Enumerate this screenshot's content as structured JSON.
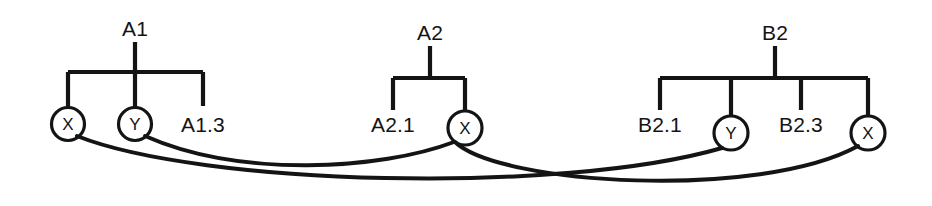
{
  "diagram": {
    "width": 932,
    "height": 206,
    "background_color": "#ffffff",
    "line_color": "#141414",
    "node_fill_color": "#ffffff"
  },
  "trees": [
    {
      "id": "A1",
      "root_label": "A1",
      "root_x": 135,
      "root_label_y": 36,
      "stem_top_y": 42,
      "bar_y": 72,
      "children": [
        {
          "id": "A1-x",
          "label": "X",
          "type": "circle",
          "x": 68,
          "cy": 124,
          "r": 16.5,
          "drop_to_y": 107.5
        },
        {
          "id": "A1-y",
          "label": "Y",
          "type": "circle",
          "x": 135,
          "cy": 124,
          "r": 16.5,
          "drop_to_y": 107.5
        },
        {
          "id": "A1-3",
          "label": "A1.3",
          "type": "leaf",
          "x": 203,
          "drop_to_y": 106,
          "label_y": 132
        }
      ]
    },
    {
      "id": "A2",
      "root_label": "A2",
      "root_x": 430,
      "root_label_y": 40,
      "stem_top_y": 46,
      "bar_y": 78,
      "children": [
        {
          "id": "A2-1",
          "label": "A2.1",
          "type": "leaf",
          "x": 393,
          "drop_to_y": 110,
          "label_y": 132
        },
        {
          "id": "A2-x",
          "label": "X",
          "type": "circle",
          "x": 465,
          "cy": 128,
          "r": 17.0,
          "drop_to_y": 111
        }
      ]
    },
    {
      "id": "B2",
      "root_label": "B2",
      "root_x": 775,
      "root_label_y": 40,
      "stem_top_y": 46,
      "bar_y": 78,
      "children": [
        {
          "id": "B2-1",
          "label": "B2.1",
          "type": "leaf",
          "x": 660,
          "drop_to_y": 110,
          "label_y": 132
        },
        {
          "id": "B2-y",
          "label": "Y",
          "type": "circle",
          "x": 731,
          "cy": 133,
          "r": 17.0,
          "drop_to_y": 116
        },
        {
          "id": "B2-3",
          "label": "B2.3",
          "type": "leaf",
          "x": 801,
          "drop_to_y": 110,
          "label_y": 132
        },
        {
          "id": "B2-x",
          "label": "X",
          "type": "circle",
          "x": 868,
          "cy": 133,
          "r": 17.0,
          "drop_to_y": 116
        }
      ]
    }
  ],
  "links": [
    {
      "id": "link-a1x-b2y",
      "from": "A1-x",
      "to": "B2-y",
      "path": "M 77 136 C 200 185, 560 195, 722 148"
    },
    {
      "id": "link-a1y-a2x",
      "from": "A1-y",
      "to": "A2-x",
      "path": "M 145 136 C 240 178, 380 170, 454 142"
    },
    {
      "id": "link-a2x-b2x",
      "from": "A2-x",
      "to": "B2-x",
      "path": "M 455 142 C 500 185, 760 200, 858 146"
    }
  ]
}
